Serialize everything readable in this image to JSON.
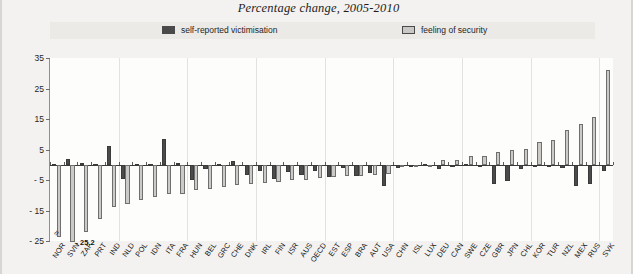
{
  "chart": {
    "title": "Percentage change, 2005-2010",
    "legend": [
      {
        "label": "self-reported victimisation",
        "color": "#4b4b4b"
      },
      {
        "label": "feeling of security",
        "color": "#cbcac6"
      }
    ],
    "annotation": "- 25.2"
  },
  "chart_data": {
    "type": "bar",
    "title": "Percentage change, 2005-2010",
    "xlabel": "",
    "ylabel": "",
    "ylim": [
      -25,
      35
    ],
    "yticks": [
      35,
      25,
      15,
      5,
      -5,
      -15,
      -25
    ],
    "ytick_labels": [
      "35",
      "25",
      "15",
      "5",
      "- 5",
      "- 15",
      "- 25"
    ],
    "grid": false,
    "legend_position": "top",
    "categories": [
      "NOR",
      "SVN",
      "ZAF",
      "PRT",
      "IND",
      "NLD",
      "POL",
      "IDN",
      "ITA",
      "FRA",
      "HUN",
      "BEL",
      "GRC",
      "CHE",
      "DNK",
      "IRL",
      "FIN",
      "ISR",
      "AUS",
      "OECD",
      "EST",
      "ESP",
      "BRA",
      "AUT",
      "USA",
      "CHN",
      "ISL",
      "LUX",
      "DEU",
      "CAN",
      "SWE",
      "CZE",
      "GBR",
      "JPN",
      "CHL",
      "KOR",
      "TUR",
      "NZL",
      "MEX",
      "RUS",
      "SVK"
    ],
    "series": [
      {
        "name": "self-reported victimisation",
        "color": "#4b4b4b",
        "values": [
          0.4,
          1.8,
          0.6,
          0.3,
          6.2,
          -4.8,
          0.4,
          0.3,
          8.6,
          0.5,
          -5.1,
          -1.4,
          0.4,
          1.3,
          -3.4,
          -2.2,
          -4.6,
          -2.3,
          -3.4,
          -2.0,
          -3.9,
          -1.2,
          -3.6,
          -2.6,
          -7.0,
          -1.1,
          -0.7,
          0.4,
          -1.3,
          -0.3,
          0.3,
          -0.6,
          -6.3,
          -5.2,
          -1.5,
          -0.6,
          -0.9,
          -1.1,
          -6.9,
          -6.4,
          -2.0
        ]
      },
      {
        "name": "feeling of security",
        "color": "#cbcac6",
        "values": [
          -23.6,
          -25.2,
          -22.0,
          -17.9,
          -13.9,
          -12.8,
          -11.4,
          -10.5,
          -9.6,
          -9.7,
          -8.4,
          -8.0,
          -7.4,
          -6.5,
          -6.3,
          -6.0,
          -5.7,
          -5.1,
          -4.9,
          -4.3,
          -4.0,
          -3.8,
          -3.6,
          -3.3,
          -3.0,
          -0.9,
          -0.6,
          -0.5,
          1.4,
          1.6,
          2.9,
          3.0,
          4.1,
          5.0,
          5.2,
          7.6,
          8.2,
          11.3,
          13.5,
          15.6,
          31.0
        ]
      }
    ],
    "annotations": [
      {
        "text": "- 25.2",
        "category": "SVN",
        "series": "feeling of security"
      }
    ]
  }
}
